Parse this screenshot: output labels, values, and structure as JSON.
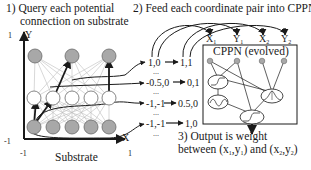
{
  "steps": {
    "step1_line1": "1) Query each potential",
    "step1_line2": "connection on substrate",
    "step2": "2) Feed each coordinate pair into CPPN",
    "step3_line1": "3) Output is weight",
    "step3_line2_prefix": "between (x",
    "step3_line2_mid1": ",y",
    "step3_line2_mid2": ") and (x",
    "step3_line2_mid3": ",y",
    "step3_line2_suffix": ")",
    "sub1": "1",
    "sub2": "2"
  },
  "substrate": {
    "label": "Substrate",
    "y_axis_label": "Y",
    "x_axis_label": "X",
    "y_max": "1",
    "y_min": "-1",
    "x_min": "-1",
    "x_max": "1",
    "layers": [
      {
        "name": "top",
        "count": 3,
        "fill": "#a8a8a8"
      },
      {
        "name": "hidden",
        "count": 5,
        "fill": "#ffffff"
      },
      {
        "name": "bottom",
        "count": 5,
        "fill": "#a8a8a8"
      }
    ]
  },
  "coordinate_pairs": [
    {
      "from": "1,0",
      "to": "1,1"
    },
    {
      "from": "-0.5,0",
      "to": "0,1"
    },
    {
      "from": "-1,-1",
      "to": "0.5,0"
    },
    {
      "from": "-1,-1",
      "to": "1,0"
    }
  ],
  "ellipsis": "...",
  "cppn": {
    "title": "CPPN (evolved)",
    "inputs": [
      "X",
      "Y",
      "X",
      "Y"
    ],
    "input_subs": [
      "1",
      "1",
      "2",
      "2"
    ]
  },
  "colors": {
    "stroke": "#1a1a1a",
    "grid_line": "#bdbdbd",
    "node_gray": "#a8a8a8",
    "node_white": "#ffffff"
  }
}
